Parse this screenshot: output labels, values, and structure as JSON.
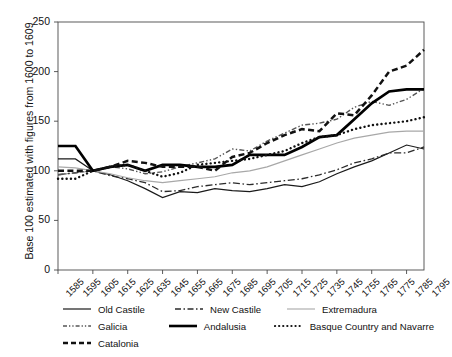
{
  "axes": {
    "ylabel": "Base 100 estimated with figures from 1600 to 1609",
    "yticks": [
      "0",
      "50",
      "100",
      "150",
      "200",
      "250"
    ],
    "ylim": [
      0,
      250
    ],
    "xticks": [
      "1585",
      "1595",
      "1605",
      "1615",
      "1625",
      "1635",
      "1645",
      "1655",
      "1665",
      "1675",
      "1685",
      "1695",
      "1705",
      "1715",
      "1725",
      "1735",
      "1745",
      "1755",
      "1765",
      "1775",
      "1785",
      "1795"
    ]
  },
  "legend": {
    "items": [
      {
        "label": "Old Castile",
        "style": "thin-solid-dark"
      },
      {
        "label": "New Castile",
        "style": "dash-dot"
      },
      {
        "label": "Extremadura",
        "style": "thin-solid-light"
      },
      {
        "label": "Galicia",
        "style": "dash-dot-dot"
      },
      {
        "label": "Andalusia",
        "style": "thick-solid"
      },
      {
        "label": "Basque Country and Navarre",
        "style": "dotted"
      },
      {
        "label": "Catalonia",
        "style": "thick-dashed"
      }
    ]
  },
  "chart_data": {
    "type": "line",
    "title": "",
    "xlabel": "",
    "ylabel": "Base 100 estimated with figures from 1600 to 1609",
    "ylim": [
      0,
      250
    ],
    "grid": false,
    "legend_position": "bottom",
    "x": [
      1585,
      1595,
      1605,
      1615,
      1625,
      1635,
      1645,
      1655,
      1665,
      1675,
      1685,
      1695,
      1705,
      1715,
      1725,
      1735,
      1745,
      1755,
      1765,
      1775,
      1785,
      1795
    ],
    "series": [
      {
        "name": "Old Castile",
        "color": "#1a1a1a",
        "values": [
          112,
          112,
          100,
          96,
          90,
          82,
          73,
          79,
          78,
          82,
          80,
          79,
          82,
          86,
          84,
          89,
          97,
          104,
          110,
          118,
          126,
          122
        ]
      },
      {
        "name": "New Castile",
        "color": "#2b2b2b",
        "values": [
          96,
          98,
          100,
          95,
          92,
          88,
          79,
          80,
          84,
          86,
          88,
          86,
          88,
          90,
          92,
          96,
          101,
          108,
          112,
          118,
          118,
          124
        ]
      },
      {
        "name": "Extremadura",
        "color": "#a8a8a8",
        "values": [
          104,
          103,
          100,
          97,
          93,
          90,
          88,
          90,
          92,
          94,
          98,
          100,
          104,
          110,
          116,
          122,
          128,
          133,
          136,
          139,
          140,
          140
        ]
      },
      {
        "name": "Galicia",
        "color": "#555555",
        "values": [
          96,
          98,
          100,
          104,
          102,
          97,
          99,
          104,
          108,
          112,
          122,
          120,
          130,
          138,
          146,
          148,
          152,
          164,
          170,
          166,
          172,
          183
        ]
      },
      {
        "name": "Andalusia",
        "color": "#000000",
        "values": [
          125,
          125,
          100,
          104,
          106,
          100,
          106,
          106,
          104,
          104,
          106,
          116,
          116,
          116,
          124,
          134,
          136,
          152,
          168,
          180,
          182,
          182
        ]
      },
      {
        "name": "Basque Country and Navarre",
        "color": "#111111",
        "values": [
          92,
          92,
          100,
          104,
          106,
          100,
          94,
          98,
          106,
          108,
          110,
          112,
          116,
          120,
          128,
          134,
          136,
          142,
          146,
          148,
          150,
          154
        ]
      },
      {
        "name": "Catalonia",
        "color": "#111111",
        "values": [
          100,
          100,
          100,
          104,
          110,
          108,
          104,
          104,
          104,
          100,
          114,
          118,
          128,
          136,
          142,
          140,
          158,
          156,
          176,
          200,
          206,
          222
        ]
      }
    ]
  }
}
